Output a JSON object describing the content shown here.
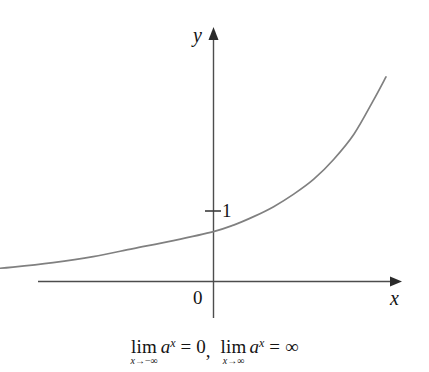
{
  "figure": {
    "background_color": "#ffffff",
    "axis_color": "#4d4d4d",
    "curve_color": "#808080",
    "text_color": "#141414",
    "y_axis_label": "y",
    "x_axis_label": "x",
    "origin_label": "0",
    "y_intercept_label": "1"
  },
  "caption": {
    "limit1": {
      "operator": "lim",
      "subscript_variable": "x",
      "subscript_arrow": "→",
      "subscript_target": "−∞",
      "base": "a",
      "exponent": "x",
      "equals": "=",
      "value": "0"
    },
    "separator": ",",
    "limit2": {
      "operator": "lim",
      "subscript_variable": "x",
      "subscript_arrow": "→",
      "subscript_target": "∞",
      "base": "a",
      "exponent": "x",
      "equals": "=",
      "value": "∞"
    }
  },
  "chart_data": {
    "type": "line",
    "title": "",
    "subtitle": "",
    "xlabel": "x",
    "ylabel": "y",
    "function": "y = a^x, a > 1",
    "legend": [],
    "grid": false,
    "xlim": [
      -5.0,
      2.2
    ],
    "ylim": [
      -0.3,
      5.1
    ],
    "axis_arrows": {
      "x": "right",
      "y": "up"
    },
    "tick_labels": {
      "x": [
        "0"
      ],
      "y": [
        "1"
      ]
    },
    "annotations": [
      {
        "text": "1",
        "x": 0,
        "y": 1,
        "note": "y-intercept tick label"
      },
      {
        "text": "0",
        "x": 0,
        "y": 0,
        "note": "origin label"
      }
    ],
    "series": [
      {
        "name": "a^x",
        "color": "#808080",
        "x": [
          -5.0,
          -4.5,
          -4.0,
          -3.5,
          -3.0,
          -2.5,
          -2.0,
          -1.5,
          -1.0,
          -0.5,
          0.0,
          0.25,
          0.5,
          0.75,
          1.0,
          1.25,
          1.5,
          1.75,
          2.0,
          2.15
        ],
        "y": [
          0.08,
          0.1,
          0.13,
          0.17,
          0.22,
          0.29,
          0.38,
          0.5,
          0.66,
          0.82,
          1.0,
          1.13,
          1.3,
          1.5,
          1.75,
          2.05,
          2.45,
          2.95,
          3.65,
          4.1
        ]
      }
    ]
  }
}
